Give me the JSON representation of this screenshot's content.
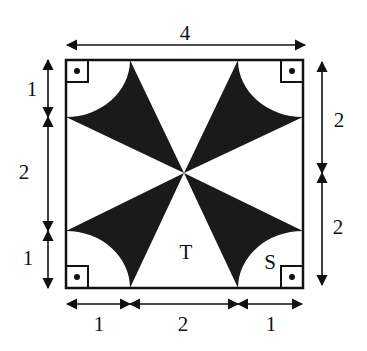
{
  "diagram": {
    "type": "geometry-figure",
    "colors": {
      "ink": "#111111",
      "shade": "#1a1a1a",
      "background": "#ffffff"
    },
    "dimensions": {
      "top": "4",
      "left": [
        "1",
        "2",
        "1"
      ],
      "right": [
        "2",
        "2"
      ],
      "bottom": [
        "1",
        "2",
        "1"
      ]
    },
    "region_labels": {
      "triangle": "T",
      "corner_region": "S"
    },
    "right_angle_markers": 4
  }
}
